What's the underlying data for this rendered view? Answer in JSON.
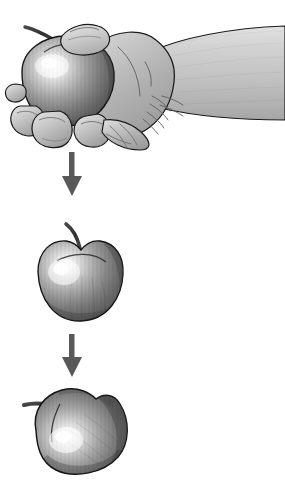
{
  "illustration": {
    "title": "Hand squeezing an apple causing deformation",
    "subject": "apple",
    "background_color": "#ffffff",
    "style": "grayscale pencil-and-airbrush technical illustration",
    "panel_count": 3,
    "arrow_count": 2
  },
  "palette": {
    "background": "#ffffff",
    "outline": "#111111",
    "apple_highlight": "#f4f4f4",
    "apple_midtone": "#9a9a9a",
    "apple_shadow": "#5e5e5e",
    "apple_deep_shadow": "#4a4a4a",
    "stem_dark": "#3a3a3a",
    "skin_light": "#d6d6d6",
    "skin_mid": "#b4b4b4",
    "skin_shadow": "#8e8e8e",
    "arm_light": "#d9d9d9",
    "arm_mid": "#bdbdbd",
    "arrow_fill": "#595959",
    "crease_line": "#6b6b6b"
  },
  "panels": [
    {
      "id": "panel-hand-squeezing-apple",
      "label": "Hand squeezing apple",
      "order": 1,
      "elements": [
        "forearm",
        "fist",
        "thumb",
        "fingers",
        "apple-squeezed",
        "apple-stem"
      ],
      "bounds": {
        "x": 6,
        "y": 20,
        "width": 279,
        "height": 125
      }
    },
    {
      "id": "panel-whole-apple",
      "label": "Whole apple",
      "order": 2,
      "elements": [
        "apple-body",
        "apple-stem",
        "apple-calyx-line"
      ],
      "bounds": {
        "x": 36,
        "y": 222,
        "width": 90,
        "height": 102
      }
    },
    {
      "id": "panel-deformed-apple",
      "label": "Deformed apple",
      "order": 3,
      "elements": [
        "apple-body-deformed",
        "apple-stem-left"
      ],
      "bounds": {
        "x": 22,
        "y": 382,
        "width": 110,
        "height": 98
      }
    }
  ],
  "arrows": [
    {
      "id": "arrow-1",
      "label": "downward arrow from hand to whole apple",
      "direction": "down",
      "x": 72,
      "y_start": 152,
      "y_end": 195,
      "color": "#595959"
    },
    {
      "id": "arrow-2",
      "label": "downward arrow from whole apple to deformed apple",
      "direction": "down",
      "x": 72,
      "y_start": 334,
      "y_end": 376,
      "color": "#595959"
    }
  ]
}
